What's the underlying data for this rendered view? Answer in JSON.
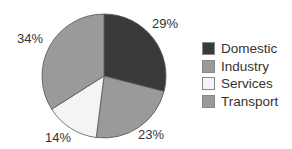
{
  "chart_data": {
    "type": "pie",
    "title": "",
    "categories": [
      "Domestic",
      "Industry",
      "Services",
      "Transport"
    ],
    "values": [
      29,
      23,
      14,
      34
    ],
    "unit": "%",
    "colors": [
      "#3a3a3a",
      "#9a9a9a",
      "#f4f4f4",
      "#9a9a9a"
    ],
    "legend_position": "right",
    "start_angle": "12 o'clock, clockwise"
  },
  "labels": [
    "29%",
    "23%",
    "14%",
    "34%"
  ],
  "legend": [
    "Domestic",
    "Industry",
    "Services",
    "Transport"
  ]
}
